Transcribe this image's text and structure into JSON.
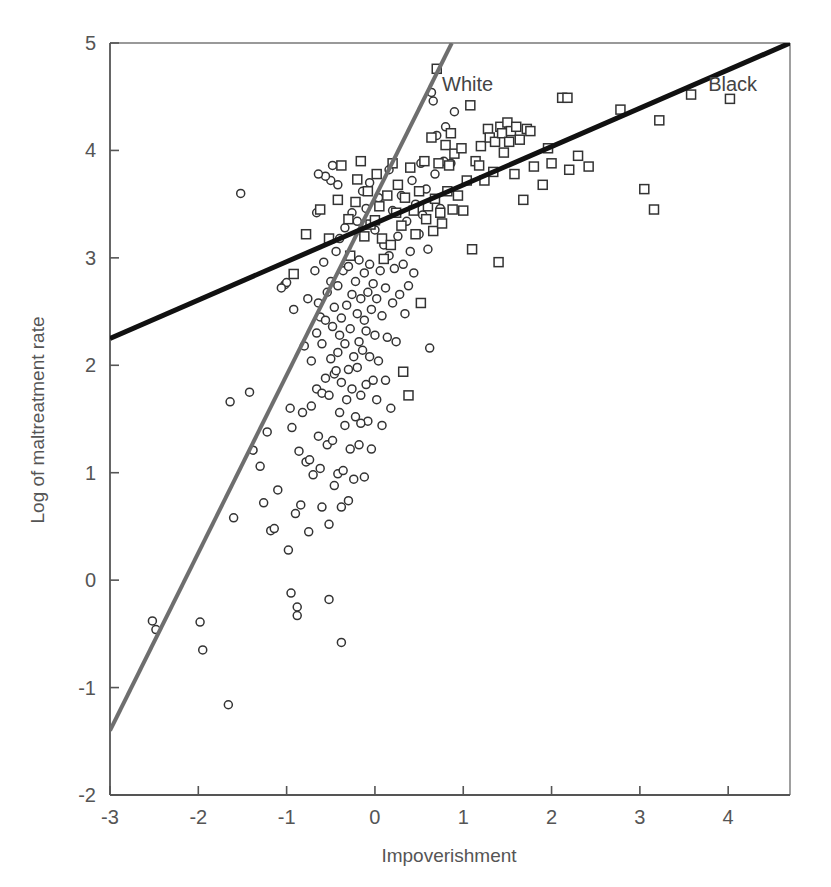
{
  "chart_data": {
    "type": "scatter",
    "title": "",
    "xlabel": "Impoverishment",
    "ylabel": "Log of maltreatment rate",
    "xlim": [
      -3,
      4.7
    ],
    "ylim": [
      -2,
      5
    ],
    "xticks": [
      -3,
      -2,
      -1,
      0,
      1,
      2,
      3,
      4
    ],
    "xtick_labels": [
      "-3",
      "-2",
      "-1",
      "0",
      "1",
      "2",
      "3",
      "4"
    ],
    "yticks": [
      -2,
      -1,
      0,
      1,
      2,
      3,
      4,
      5
    ],
    "ytick_labels": [
      "-2",
      "-1",
      "0",
      "1",
      "2",
      "3",
      "4",
      "5"
    ],
    "grid": false,
    "legend_position": "inline-annotation",
    "annotations": [
      {
        "text": "White",
        "x": 1.05,
        "y": 4.55,
        "color": "#444444"
      },
      {
        "text": "Black",
        "x": 4.05,
        "y": 4.55,
        "color": "#444444"
      }
    ],
    "series": [
      {
        "name": "Black",
        "marker": "square",
        "marker_size": 9,
        "fill": "none",
        "edge_color": "#333333",
        "fit_line": {
          "label": "Black",
          "color": "#111111",
          "width": 5,
          "x0": -3,
          "y0": 2.25,
          "x1": 4.7,
          "y1": 5.0,
          "slope": 0.357,
          "intercept": 3.32
        },
        "points": [
          [
            -0.92,
            2.85
          ],
          [
            -0.78,
            3.22
          ],
          [
            -0.62,
            3.45
          ],
          [
            -0.52,
            3.18
          ],
          [
            -0.42,
            3.54
          ],
          [
            -0.38,
            3.86
          ],
          [
            -0.3,
            3.36
          ],
          [
            -0.28,
            3.02
          ],
          [
            -0.22,
            3.52
          ],
          [
            -0.2,
            3.73
          ],
          [
            -0.16,
            3.9
          ],
          [
            -0.12,
            3.2
          ],
          [
            -0.08,
            3.62
          ],
          [
            -0.05,
            3.31
          ],
          [
            0.0,
            3.35
          ],
          [
            0.02,
            3.78
          ],
          [
            0.05,
            3.48
          ],
          [
            0.08,
            3.18
          ],
          [
            0.1,
            2.99
          ],
          [
            0.14,
            3.58
          ],
          [
            0.18,
            3.12
          ],
          [
            0.2,
            3.88
          ],
          [
            0.24,
            3.42
          ],
          [
            0.26,
            3.68
          ],
          [
            0.3,
            3.3
          ],
          [
            0.32,
            1.94
          ],
          [
            0.34,
            3.56
          ],
          [
            0.38,
            1.72
          ],
          [
            0.4,
            3.84
          ],
          [
            0.44,
            3.44
          ],
          [
            0.46,
            3.22
          ],
          [
            0.5,
            3.62
          ],
          [
            0.52,
            2.58
          ],
          [
            0.56,
            3.9
          ],
          [
            0.58,
            3.36
          ],
          [
            0.6,
            3.48
          ],
          [
            0.64,
            4.12
          ],
          [
            0.66,
            3.25
          ],
          [
            0.68,
            3.55
          ],
          [
            0.7,
            4.76
          ],
          [
            0.72,
            3.88
          ],
          [
            0.74,
            3.42
          ],
          [
            0.76,
            3.32
          ],
          [
            0.8,
            4.05
          ],
          [
            0.82,
            3.62
          ],
          [
            0.84,
            3.86
          ],
          [
            0.86,
            4.16
          ],
          [
            0.88,
            3.45
          ],
          [
            0.9,
            3.97
          ],
          [
            0.94,
            3.58
          ],
          [
            0.98,
            4.02
          ],
          [
            1.0,
            3.44
          ],
          [
            1.04,
            3.72
          ],
          [
            1.08,
            4.42
          ],
          [
            1.1,
            3.08
          ],
          [
            1.14,
            3.9
          ],
          [
            1.18,
            3.86
          ],
          [
            1.2,
            4.04
          ],
          [
            1.24,
            3.72
          ],
          [
            1.28,
            4.2
          ],
          [
            1.3,
            4.12
          ],
          [
            1.34,
            3.8
          ],
          [
            1.36,
            4.08
          ],
          [
            1.4,
            2.96
          ],
          [
            1.42,
            4.22
          ],
          [
            1.44,
            4.16
          ],
          [
            1.46,
            3.98
          ],
          [
            1.5,
            4.26
          ],
          [
            1.52,
            4.08
          ],
          [
            1.54,
            4.18
          ],
          [
            1.58,
            3.78
          ],
          [
            1.6,
            4.22
          ],
          [
            1.64,
            4.1
          ],
          [
            1.68,
            3.54
          ],
          [
            1.72,
            4.2
          ],
          [
            1.76,
            4.18
          ],
          [
            1.8,
            3.85
          ],
          [
            1.9,
            3.68
          ],
          [
            1.96,
            4.02
          ],
          [
            2.0,
            3.88
          ],
          [
            2.12,
            4.49
          ],
          [
            2.18,
            4.49
          ],
          [
            2.2,
            3.82
          ],
          [
            2.3,
            3.95
          ],
          [
            2.42,
            3.85
          ],
          [
            2.78,
            4.38
          ],
          [
            3.05,
            3.64
          ],
          [
            3.16,
            3.45
          ],
          [
            3.22,
            4.28
          ],
          [
            3.58,
            4.52
          ],
          [
            4.02,
            4.48
          ]
        ]
      },
      {
        "name": "White",
        "marker": "circle",
        "marker_size": 8,
        "fill": "none",
        "edge_color": "#333333",
        "fit_line": {
          "label": "White",
          "color": "#6e6e6e",
          "width": 4,
          "x0": -3,
          "y0": -1.4,
          "x1": 0.87,
          "y1": 5.0,
          "slope": 1.654,
          "intercept": 3.56
        },
        "points": [
          [
            -2.52,
            -0.38
          ],
          [
            -2.48,
            -0.46
          ],
          [
            -1.98,
            -0.39
          ],
          [
            -1.95,
            -0.65
          ],
          [
            -1.66,
            -1.16
          ],
          [
            -1.64,
            1.66
          ],
          [
            -1.6,
            0.58
          ],
          [
            -1.42,
            1.75
          ],
          [
            -1.38,
            1.21
          ],
          [
            -1.3,
            1.06
          ],
          [
            -1.26,
            0.72
          ],
          [
            -1.22,
            1.38
          ],
          [
            -1.18,
            0.46
          ],
          [
            -1.14,
            0.48
          ],
          [
            -1.1,
            0.84
          ],
          [
            -1.02,
            2.75
          ],
          [
            -1.0,
            2.77
          ],
          [
            -0.98,
            0.28
          ],
          [
            -0.96,
            1.6
          ],
          [
            -0.95,
            -0.12
          ],
          [
            -0.94,
            1.42
          ],
          [
            -0.92,
            2.52
          ],
          [
            -0.9,
            0.62
          ],
          [
            -0.88,
            -0.25
          ],
          [
            -0.88,
            -0.33
          ],
          [
            -0.86,
            1.2
          ],
          [
            -0.84,
            0.7
          ],
          [
            -0.82,
            1.56
          ],
          [
            -0.8,
            2.18
          ],
          [
            -0.78,
            1.1
          ],
          [
            -0.76,
            2.62
          ],
          [
            -0.75,
            0.45
          ],
          [
            -0.74,
            1.12
          ],
          [
            -0.72,
            1.62
          ],
          [
            -0.72,
            2.04
          ],
          [
            -0.7,
            0.98
          ],
          [
            -0.68,
            2.88
          ],
          [
            -0.66,
            1.78
          ],
          [
            -0.66,
            2.3
          ],
          [
            -0.64,
            1.34
          ],
          [
            -0.64,
            2.58
          ],
          [
            -0.62,
            1.04
          ],
          [
            -0.62,
            2.45
          ],
          [
            -0.6,
            0.68
          ],
          [
            -0.6,
            1.74
          ],
          [
            -0.6,
            2.2
          ],
          [
            -0.58,
            2.96
          ],
          [
            -0.56,
            1.88
          ],
          [
            -0.56,
            2.42
          ],
          [
            -0.54,
            1.26
          ],
          [
            -0.54,
            2.68
          ],
          [
            -0.52,
            -0.18
          ],
          [
            -0.52,
            0.52
          ],
          [
            -0.52,
            1.72
          ],
          [
            -0.5,
            2.06
          ],
          [
            -0.5,
            2.78
          ],
          [
            -0.48,
            1.3
          ],
          [
            -0.48,
            2.36
          ],
          [
            -0.46,
            0.88
          ],
          [
            -0.46,
            1.92
          ],
          [
            -0.46,
            2.54
          ],
          [
            -0.44,
            3.06
          ],
          [
            -0.42,
            0.99
          ],
          [
            -0.42,
            2.12
          ],
          [
            -0.42,
            2.74
          ],
          [
            -0.4,
            1.56
          ],
          [
            -0.4,
            2.28
          ],
          [
            -0.4,
            3.18
          ],
          [
            -0.38,
            -0.58
          ],
          [
            -0.38,
            0.68
          ],
          [
            -0.38,
            1.84
          ],
          [
            -0.38,
            2.44
          ],
          [
            -0.36,
            1.02
          ],
          [
            -0.36,
            2.88
          ],
          [
            -0.34,
            1.44
          ],
          [
            -0.34,
            2.2
          ],
          [
            -0.34,
            3.28
          ],
          [
            -0.32,
            1.68
          ],
          [
            -0.32,
            2.56
          ],
          [
            -0.3,
            0.74
          ],
          [
            -0.3,
            1.96
          ],
          [
            -0.3,
            2.92
          ],
          [
            -0.28,
            1.22
          ],
          [
            -0.28,
            2.34
          ],
          [
            -0.26,
            1.78
          ],
          [
            -0.26,
            2.66
          ],
          [
            -0.26,
            3.42
          ],
          [
            -0.24,
            0.94
          ],
          [
            -0.24,
            2.08
          ],
          [
            -0.22,
            1.52
          ],
          [
            -0.22,
            2.78
          ],
          [
            -0.2,
            1.98
          ],
          [
            -0.2,
            2.48
          ],
          [
            -0.2,
            3.34
          ],
          [
            -0.18,
            1.26
          ],
          [
            -0.18,
            2.22
          ],
          [
            -0.18,
            2.98
          ],
          [
            -0.16,
            1.72
          ],
          [
            -0.16,
            2.62
          ],
          [
            -0.14,
            2.14
          ],
          [
            -0.14,
            3.62
          ],
          [
            -0.12,
            0.96
          ],
          [
            -0.12,
            2.42
          ],
          [
            -0.12,
            2.86
          ],
          [
            -0.1,
            1.82
          ],
          [
            -0.1,
            2.32
          ],
          [
            -0.1,
            3.46
          ],
          [
            -0.08,
            1.48
          ],
          [
            -0.08,
            2.68
          ],
          [
            -0.06,
            2.08
          ],
          [
            -0.06,
            2.94
          ],
          [
            -0.06,
            3.7
          ],
          [
            -0.04,
            1.22
          ],
          [
            -0.04,
            2.52
          ],
          [
            -0.02,
            1.86
          ],
          [
            -0.02,
            2.76
          ],
          [
            0.0,
            2.28
          ],
          [
            0.0,
            3.26
          ],
          [
            0.02,
            1.68
          ],
          [
            0.02,
            2.62
          ],
          [
            0.04,
            2.04
          ],
          [
            0.04,
            3.56
          ],
          [
            0.06,
            2.88
          ],
          [
            0.08,
            1.44
          ],
          [
            0.08,
            2.46
          ],
          [
            0.1,
            3.12
          ],
          [
            0.12,
            1.86
          ],
          [
            0.12,
            2.72
          ],
          [
            0.14,
            2.26
          ],
          [
            0.16,
            3.02
          ],
          [
            0.16,
            3.82
          ],
          [
            0.18,
            1.6
          ],
          [
            0.2,
            2.58
          ],
          [
            0.2,
            3.44
          ],
          [
            0.22,
            2.9
          ],
          [
            0.24,
            2.22
          ],
          [
            0.26,
            3.2
          ],
          [
            0.28,
            2.66
          ],
          [
            0.3,
            3.58
          ],
          [
            0.32,
            2.94
          ],
          [
            0.34,
            2.48
          ],
          [
            0.36,
            3.34
          ],
          [
            0.38,
            2.74
          ],
          [
            0.4,
            3.06
          ],
          [
            0.42,
            3.72
          ],
          [
            0.44,
            2.86
          ],
          [
            0.46,
            3.5
          ],
          [
            0.5,
            3.22
          ],
          [
            0.52,
            3.88
          ],
          [
            0.54,
            3.4
          ],
          [
            0.58,
            3.64
          ],
          [
            0.6,
            3.08
          ],
          [
            0.62,
            2.16
          ],
          [
            0.64,
            4.54
          ],
          [
            0.66,
            4.46
          ],
          [
            0.68,
            3.78
          ],
          [
            0.7,
            4.14
          ],
          [
            0.74,
            3.46
          ],
          [
            0.78,
            3.9
          ],
          [
            0.8,
            4.22
          ],
          [
            0.86,
            3.88
          ],
          [
            0.9,
            4.36
          ],
          [
            -1.52,
            3.6
          ],
          [
            -0.16,
            1.46
          ],
          [
            -1.06,
            2.72
          ],
          [
            -0.44,
            1.95
          ],
          [
            -0.5,
            3.72
          ],
          [
            -0.56,
            3.76
          ],
          [
            -0.66,
            3.42
          ],
          [
            -0.64,
            3.78
          ],
          [
            -0.48,
            3.86
          ],
          [
            -0.42,
            3.68
          ]
        ]
      }
    ]
  },
  "axes": {
    "x_label": "Impoverishment",
    "y_label": "Log of maltreatment rate"
  }
}
